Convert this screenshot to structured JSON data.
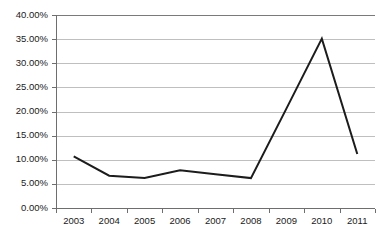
{
  "chart_data": {
    "type": "line",
    "title": "",
    "subtitle": "",
    "xlabel": "",
    "ylabel": "",
    "categories": [
      "2003",
      "2004",
      "2005",
      "2006",
      "2007",
      "2008",
      "2009",
      "2010",
      "2011"
    ],
    "series": [
      {
        "name": "",
        "values": [
          10.7,
          6.7,
          6.2,
          7.8,
          7.0,
          6.2,
          20.6,
          35.1,
          11.2
        ],
        "color": "#1c1c1c"
      }
    ],
    "ylim": [
      0,
      40
    ],
    "ytick_values": [
      0,
      5,
      10,
      15,
      20,
      25,
      30,
      35,
      40
    ],
    "ytick_labels": [
      "0.00%",
      "5.00%",
      "10.00%",
      "15.00%",
      "20.00%",
      "25.00%",
      "30.00%",
      "35.00%",
      "40.00%"
    ],
    "value_format": "percent",
    "grid": true,
    "grid_axis": "y",
    "legend": false,
    "legend_position": "none",
    "markers": false,
    "annotations": []
  },
  "style": {
    "background": "#ffffff",
    "gridline_color": "#bfbfbf",
    "top_border_color": "#7a7a7a",
    "axis_color": "#6e6e6e",
    "line_color": "#1c1c1c",
    "label_color": "#1a1a1a"
  },
  "geometry": {
    "plot_left": 56,
    "plot_right": 375,
    "plot_top": 15,
    "plot_bottom": 208
  }
}
